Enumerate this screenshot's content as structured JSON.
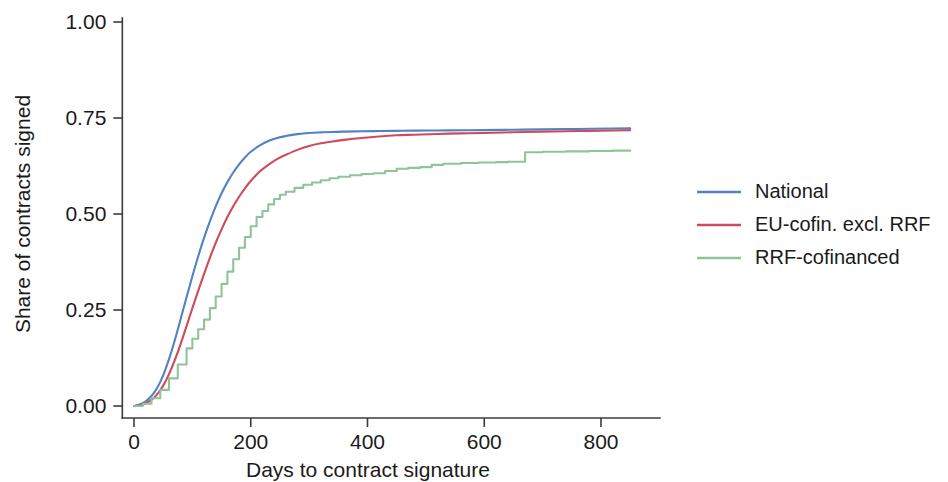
{
  "chart_data": {
    "type": "line",
    "title": "",
    "subtitle": "",
    "xlabel": "Days to contract signature",
    "ylabel": "Share of contracts signed",
    "xlim": [
      -20,
      880
    ],
    "ylim": [
      0.0,
      1.0
    ],
    "xticks": [
      0,
      200,
      400,
      600,
      800
    ],
    "xtick_labels": [
      "0",
      "200",
      "400",
      "600",
      "800"
    ],
    "yticks": [
      0.0,
      0.25,
      0.5,
      0.75,
      1.0
    ],
    "ytick_labels": [
      "0.00",
      "0.25",
      "0.50",
      "0.75",
      "1.00"
    ],
    "grid": false,
    "legend_position": "right",
    "annotations": [],
    "series": [
      {
        "name": "National",
        "color": "#5183c4",
        "x": [
          0,
          10,
          20,
          30,
          40,
          50,
          60,
          70,
          80,
          90,
          100,
          110,
          120,
          130,
          140,
          150,
          160,
          170,
          180,
          190,
          200,
          215,
          230,
          245,
          260,
          280,
          300,
          320,
          340,
          360,
          390,
          420,
          450,
          480,
          520,
          560,
          600,
          650,
          700,
          760,
          820,
          850
        ],
        "values": [
          0.0,
          0.004,
          0.012,
          0.026,
          0.048,
          0.08,
          0.122,
          0.172,
          0.227,
          0.283,
          0.338,
          0.39,
          0.438,
          0.481,
          0.52,
          0.554,
          0.583,
          0.608,
          0.629,
          0.647,
          0.662,
          0.678,
          0.69,
          0.698,
          0.703,
          0.708,
          0.711,
          0.7125,
          0.7135,
          0.7145,
          0.7155,
          0.716,
          0.7165,
          0.717,
          0.7175,
          0.718,
          0.7185,
          0.7195,
          0.7205,
          0.7215,
          0.7225,
          0.723
        ]
      },
      {
        "name": "EU-cofin. excl. RRF",
        "color": "#cf4a5c",
        "x": [
          0,
          10,
          20,
          30,
          40,
          50,
          60,
          70,
          80,
          90,
          100,
          110,
          120,
          130,
          140,
          150,
          160,
          170,
          180,
          190,
          200,
          215,
          230,
          245,
          260,
          280,
          300,
          320,
          340,
          360,
          390,
          420,
          450,
          480,
          520,
          560,
          600,
          650,
          700,
          760,
          820,
          850
        ],
        "values": [
          0.0,
          0.002,
          0.007,
          0.016,
          0.031,
          0.053,
          0.083,
          0.12,
          0.162,
          0.208,
          0.255,
          0.3,
          0.344,
          0.386,
          0.425,
          0.46,
          0.492,
          0.52,
          0.545,
          0.567,
          0.586,
          0.61,
          0.628,
          0.643,
          0.654,
          0.667,
          0.677,
          0.684,
          0.689,
          0.693,
          0.698,
          0.702,
          0.705,
          0.7065,
          0.7085,
          0.71,
          0.711,
          0.713,
          0.7145,
          0.716,
          0.7175,
          0.718
        ]
      },
      {
        "name": "RRF-cofinanced",
        "color": "#8fc49a",
        "x": [
          0,
          15,
          30,
          45,
          60,
          75,
          90,
          100,
          110,
          120,
          130,
          140,
          150,
          160,
          170,
          180,
          190,
          200,
          210,
          220,
          230,
          240,
          250,
          260,
          275,
          290,
          305,
          320,
          335,
          350,
          370,
          390,
          410,
          430,
          450,
          470,
          490,
          510,
          530,
          560,
          590,
          620,
          640,
          665,
          670,
          700,
          740,
          780,
          820,
          850
        ],
        "values": [
          0.0,
          0.006,
          0.02,
          0.042,
          0.072,
          0.108,
          0.15,
          0.175,
          0.2,
          0.225,
          0.255,
          0.285,
          0.318,
          0.35,
          0.382,
          0.412,
          0.44,
          0.468,
          0.492,
          0.508,
          0.525,
          0.539,
          0.55,
          0.558,
          0.568,
          0.576,
          0.582,
          0.588,
          0.593,
          0.597,
          0.601,
          0.604,
          0.606,
          0.612,
          0.618,
          0.62,
          0.622,
          0.628,
          0.631,
          0.633,
          0.634,
          0.635,
          0.636,
          0.636,
          0.661,
          0.662,
          0.663,
          0.664,
          0.665,
          0.665
        ]
      }
    ]
  },
  "legend": {
    "entries": [
      {
        "label": "National",
        "color": "#5183c4"
      },
      {
        "label": "EU-cofin. excl. RRF",
        "color": "#cf4a5c"
      },
      {
        "label": "RRF-cofinanced",
        "color": "#8fc49a"
      }
    ]
  },
  "axes": {
    "x_title": "Days to contract signature",
    "y_title": "Share of contracts signed",
    "x_tick_labels": [
      "0",
      "200",
      "400",
      "600",
      "800"
    ],
    "y_tick_labels": [
      "0.00",
      "0.25",
      "0.50",
      "0.75",
      "1.00"
    ]
  }
}
